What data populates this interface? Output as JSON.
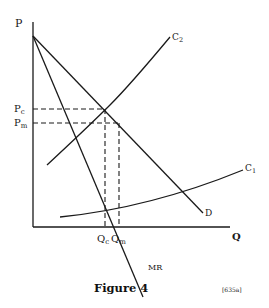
{
  "figure": {
    "caption": "Figure 4",
    "reference": "[635a]"
  },
  "axes": {
    "y_label": "P",
    "x_label": "Q"
  },
  "price_labels": {
    "pc_main": "P",
    "pc_sub": "c",
    "pm_main": "P",
    "pm_sub": "m"
  },
  "quantity_labels": {
    "qc_main": "Q",
    "qc_sub": "c",
    "qm_main": "Q",
    "qm_sub": "m"
  },
  "curves": {
    "demand": "D",
    "marginal_revenue": "MR",
    "c1_main": "C",
    "c1_sub": "1",
    "c2_main": "C",
    "c2_sub": "2"
  },
  "colors": {
    "line": "#1a1a1a",
    "background": "#ffffff"
  }
}
